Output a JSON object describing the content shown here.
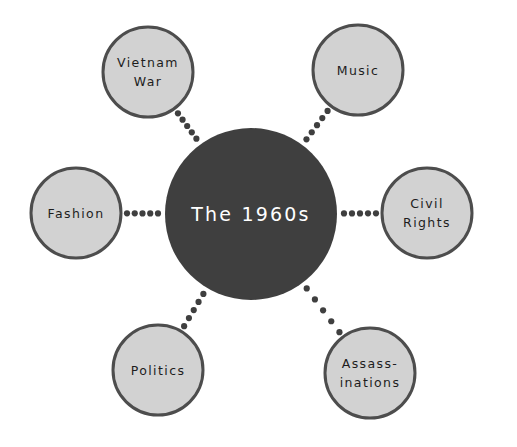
{
  "diagram": {
    "type": "mind-map",
    "title": "The 1960s",
    "background_color": "#ffffff",
    "center": {
      "label": "The 1960s",
      "cx": 251,
      "cy": 214,
      "r": 86,
      "fill": "#3f3f3f",
      "text_color": "#ffffff",
      "font_size": 19
    },
    "node_style": {
      "fill": "#d2d2d2",
      "stroke": "#4d4d4d",
      "stroke_width": 3,
      "text_color": "#1d1d1d",
      "font_size": 12.5,
      "r": 45
    },
    "connector_style": {
      "color": "#3f3f3f",
      "dot_radius": 3.1,
      "dot_count": 5
    },
    "nodes": [
      {
        "id": "vietnam-war",
        "lines": [
          "Vietnam",
          "War"
        ],
        "cx": 148,
        "cy": 72,
        "angle_deg": 215
      },
      {
        "id": "music",
        "lines": [
          "Music"
        ],
        "cx": 358,
        "cy": 70,
        "angle_deg": 325
      },
      {
        "id": "civil-rights",
        "lines": [
          "Civil",
          "Rights"
        ],
        "cx": 427,
        "cy": 213,
        "angle_deg": 0
      },
      {
        "id": "assassinations",
        "lines": [
          "Assass-",
          "inations"
        ],
        "cx": 370,
        "cy": 373,
        "angle_deg": 45
      },
      {
        "id": "politics",
        "lines": [
          "Politics"
        ],
        "cx": 158,
        "cy": 370,
        "angle_deg": 133
      },
      {
        "id": "fashion",
        "lines": [
          "Fashion"
        ],
        "cx": 76,
        "cy": 213,
        "angle_deg": 180
      }
    ]
  }
}
